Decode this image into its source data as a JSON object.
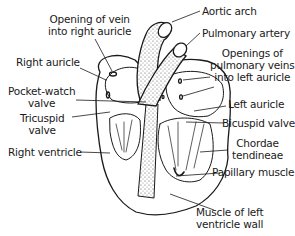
{
  "diagram": {
    "labels": {
      "opening_vein_1": "Opening of vein",
      "opening_vein_2": "into right auricle",
      "right_auricle": "Right auricle",
      "pocket_watch_1": "Pocket-watch",
      "pocket_watch_2": "valve",
      "tricuspid_1": "Tricuspid",
      "tricuspid_2": "valve",
      "right_ventricle": "Right ventricle",
      "aortic_arch": "Aortic arch",
      "pulmonary_artery": "Pulmonary artery",
      "pulm_veins_1": "Openings of",
      "pulm_veins_2": "pulmonary veins",
      "pulm_veins_3": "into left auricle",
      "left_auricle": "Left auricle",
      "bicuspid": "Bicuspid valve",
      "chordae_1": "Chordae",
      "chordae_2": "tendineae",
      "papillary": "Papillary muscle",
      "muscle_wall_1": "Muscle of left",
      "muscle_wall_2": "ventricle wall"
    }
  }
}
